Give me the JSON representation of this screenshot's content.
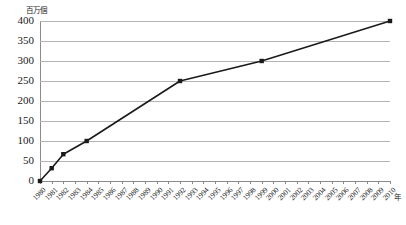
{
  "chart_data": {
    "type": "line",
    "title": "",
    "subtitle": "",
    "xlabel": "年",
    "ylabel": "百万個",
    "ylim": [
      0,
      400
    ],
    "ytick_step": 50,
    "yticks": [
      400,
      350,
      300,
      250,
      200,
      150,
      100,
      50,
      0
    ],
    "xlim": [
      1980,
      2010
    ],
    "grid": "horizontal",
    "legend": "none",
    "categories": [
      "1980",
      "1981",
      "1982",
      "1983",
      "1984",
      "1985",
      "1986",
      "1987",
      "1988",
      "1989",
      "1990",
      "1991",
      "1992",
      "1993",
      "1994",
      "1995",
      "1996",
      "1997",
      "1998",
      "1999",
      "2000",
      "2001",
      "2002",
      "2003",
      "2004",
      "2005",
      "2006",
      "2007",
      "2008",
      "2009",
      "2010"
    ],
    "series": [
      {
        "name": "",
        "color": "#1a1a1a",
        "marker": "square",
        "points": [
          {
            "x": "1980",
            "y": 0
          },
          {
            "x": "1981",
            "y": 32
          },
          {
            "x": "1982",
            "y": 67
          },
          {
            "x": "1984",
            "y": 100
          },
          {
            "x": "1992",
            "y": 250
          },
          {
            "x": "1999",
            "y": 300
          },
          {
            "x": "2010",
            "y": 400
          }
        ]
      }
    ]
  },
  "axis": {
    "y_unit_label": "百万個",
    "x_unit_label": "年"
  },
  "colors": {
    "series": "#1a1a1a",
    "grid": "#b4b4b4",
    "axis": "#8a8a8a",
    "background": "#ffffff",
    "text": "#1a1a1a"
  }
}
